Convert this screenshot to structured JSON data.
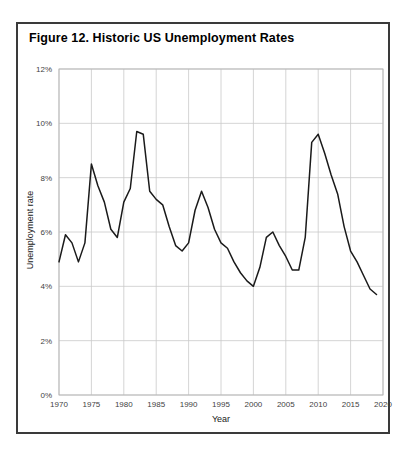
{
  "figure": {
    "title": "Figure 12. Historic US Unemployment Rates",
    "border_color": "#3a3a3a"
  },
  "chart_data": {
    "type": "line",
    "title": "Figure 12. Historic US Unemployment Rates",
    "xlabel": "Year",
    "ylabel": "Unemployment rate",
    "xlim": [
      1970,
      2020
    ],
    "ylim": [
      0,
      12
    ],
    "grid": true,
    "legend": "none",
    "line_color": "#1a1a1a",
    "x_tick_labels": [
      "1970",
      "1975",
      "1980",
      "1985",
      "1990",
      "1995",
      "2000",
      "2005",
      "2010",
      "2015",
      "2020"
    ],
    "x_ticks": [
      1970,
      1975,
      1980,
      1985,
      1990,
      1995,
      2000,
      2005,
      2010,
      2015,
      2020
    ],
    "y_tick_labels": [
      "0%",
      "2%",
      "4%",
      "6%",
      "8%",
      "10%",
      "12%"
    ],
    "y_ticks": [
      0,
      2,
      4,
      6,
      8,
      10,
      12
    ],
    "x": [
      1970,
      1971,
      1972,
      1973,
      1974,
      1975,
      1976,
      1977,
      1978,
      1979,
      1980,
      1981,
      1982,
      1983,
      1984,
      1985,
      1986,
      1987,
      1988,
      1989,
      1990,
      1991,
      1992,
      1993,
      1994,
      1995,
      1996,
      1997,
      1998,
      1999,
      2000,
      2001,
      2002,
      2003,
      2004,
      2005,
      2006,
      2007,
      2008,
      2009,
      2010,
      2011,
      2012,
      2013,
      2014,
      2015,
      2016,
      2017,
      2018,
      2019
    ],
    "values": [
      4.9,
      5.9,
      5.6,
      4.9,
      5.6,
      8.5,
      7.7,
      7.1,
      6.1,
      5.8,
      7.1,
      7.6,
      9.7,
      9.6,
      7.5,
      7.2,
      7.0,
      6.2,
      5.5,
      5.3,
      5.6,
      6.8,
      7.5,
      6.9,
      6.1,
      5.6,
      5.4,
      4.9,
      4.5,
      4.2,
      4.0,
      4.7,
      5.8,
      6.0,
      5.5,
      5.1,
      4.6,
      4.6,
      5.8,
      9.3,
      9.6,
      8.9,
      8.1,
      7.4,
      6.2,
      5.3,
      4.9,
      4.4,
      3.9,
      3.7
    ],
    "series_name": "US unemployment rate"
  }
}
